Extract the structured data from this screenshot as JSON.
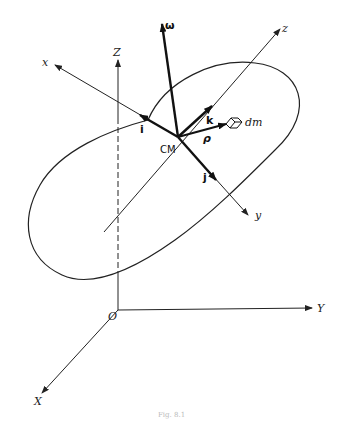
{
  "figure": {
    "caption": "Fig. 8.1"
  },
  "inertial_frame": {
    "origin_label": "O",
    "axes": {
      "X": "X",
      "Y": "Y",
      "Z": "Z"
    }
  },
  "body_frame": {
    "origin_label": "CM",
    "axes": {
      "x": "x",
      "y": "y",
      "z": "z"
    },
    "unit_vectors": {
      "i": "i",
      "j": "j",
      "k": "k"
    }
  },
  "vectors": {
    "angular_velocity": "ω",
    "position": "ρ"
  },
  "mass_element": "dm",
  "colors": {
    "ink": "#222222",
    "background": "#ffffff"
  }
}
